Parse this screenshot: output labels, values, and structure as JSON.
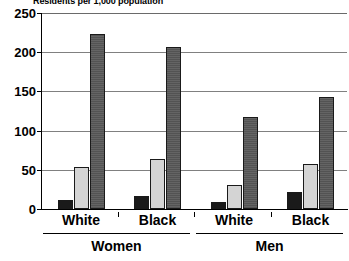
{
  "chart_data": {
    "type": "bar",
    "title": "Residents per 1,000 population",
    "subtitle": "",
    "xlabel": "",
    "ylabel": "",
    "ylim": [
      0,
      250
    ],
    "yticks": [
      0,
      50,
      100,
      150,
      200,
      250
    ],
    "ytick_labels": [
      "0",
      "50",
      "100",
      "150",
      "200",
      "250"
    ],
    "grid": true,
    "legend": false,
    "legend_position": "none",
    "categories": [
      "White",
      "Black",
      "White",
      "Black"
    ],
    "groups": [
      {
        "label": "Women",
        "categories": [
          "White",
          "Black"
        ]
      },
      {
        "label": "Men",
        "categories": [
          "White",
          "Black"
        ]
      }
    ],
    "series": [
      {
        "name": "series-1",
        "color": "#1a1a1a",
        "values": [
          11,
          16,
          9,
          22
        ]
      },
      {
        "name": "series-2",
        "color": "#d4d4d4",
        "values": [
          53,
          64,
          31,
          58
        ]
      },
      {
        "name": "series-3",
        "color": "#5c5c5c",
        "values": [
          223,
          207,
          118,
          143
        ]
      }
    ],
    "bars": [
      {
        "group": "Women",
        "category": "White",
        "series": "series-1",
        "value": 11
      },
      {
        "group": "Women",
        "category": "White",
        "series": "series-2",
        "value": 53
      },
      {
        "group": "Women",
        "category": "White",
        "series": "series-3",
        "value": 223
      },
      {
        "group": "Women",
        "category": "Black",
        "series": "series-1",
        "value": 16
      },
      {
        "group": "Women",
        "category": "Black",
        "series": "series-2",
        "value": 64
      },
      {
        "group": "Women",
        "category": "Black",
        "series": "series-3",
        "value": 207
      },
      {
        "group": "Men",
        "category": "White",
        "series": "series-1",
        "value": 9
      },
      {
        "group": "Men",
        "category": "White",
        "series": "series-2",
        "value": 31
      },
      {
        "group": "Men",
        "category": "White",
        "series": "series-3",
        "value": 118
      },
      {
        "group": "Men",
        "category": "Black",
        "series": "series-1",
        "value": 22
      },
      {
        "group": "Men",
        "category": "Black",
        "series": "series-2",
        "value": 58
      },
      {
        "group": "Men",
        "category": "Black",
        "series": "series-3",
        "value": 143
      }
    ]
  },
  "colors": {
    "series_1": "#1a1a1a",
    "series_2": "#d4d4d4",
    "series_3": "#5c5c5c",
    "axis": "#000000",
    "grid": "#808080",
    "background": "#ffffff"
  }
}
